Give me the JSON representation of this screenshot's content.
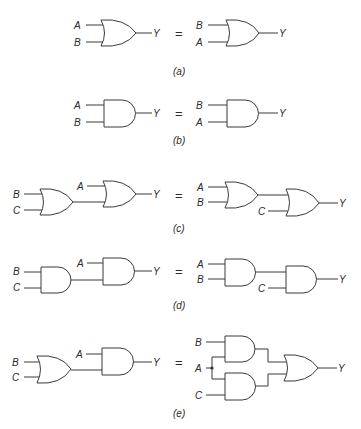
{
  "figure": {
    "equals_sign": "=",
    "panels": [
      {
        "id": "a",
        "caption": "(a)",
        "law": "commutative OR",
        "left": {
          "inputs": [
            "A",
            "B"
          ],
          "output": "Y"
        },
        "right": {
          "inputs": [
            "B",
            "A"
          ],
          "output": "Y"
        }
      },
      {
        "id": "b",
        "caption": "(b)",
        "law": "commutative AND",
        "left": {
          "inputs": [
            "A",
            "B"
          ],
          "output": "Y"
        },
        "right": {
          "inputs": [
            "B",
            "A"
          ],
          "output": "Y"
        }
      },
      {
        "id": "c",
        "caption": "(c)",
        "law": "associative OR",
        "left": {
          "inputs": [
            "B",
            "C",
            "A"
          ],
          "output": "Y"
        },
        "right": {
          "inputs": [
            "A",
            "B",
            "C"
          ],
          "output": "Y"
        }
      },
      {
        "id": "d",
        "caption": "(d)",
        "law": "associative AND",
        "left": {
          "inputs": [
            "B",
            "C",
            "A"
          ],
          "output": "Y"
        },
        "right": {
          "inputs": [
            "A",
            "B",
            "C"
          ],
          "output": "Y"
        }
      },
      {
        "id": "e",
        "caption": "(e)",
        "law": "distributive",
        "left": {
          "inputs": [
            "B",
            "C",
            "A"
          ],
          "output": "Y"
        },
        "right": {
          "inputs": [
            "B",
            "A",
            "C"
          ],
          "output": "Y"
        }
      }
    ]
  }
}
